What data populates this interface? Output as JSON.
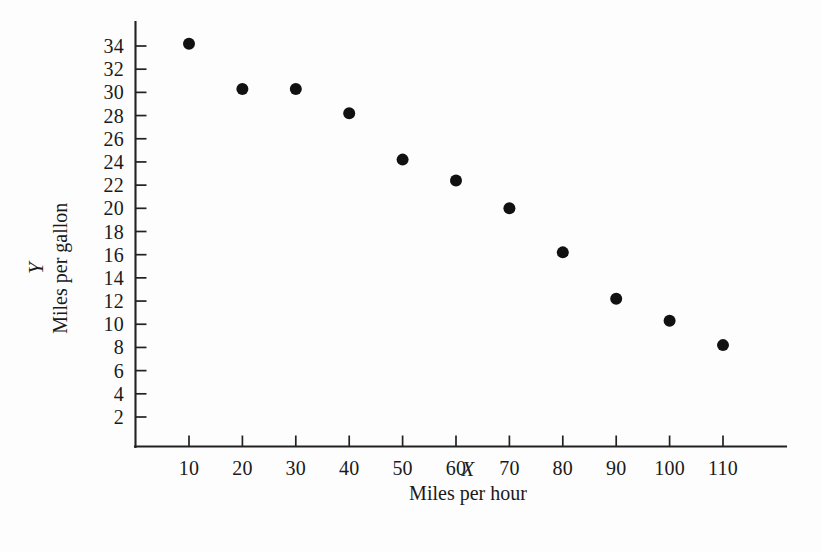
{
  "chart_data": {
    "type": "scatter",
    "title": "",
    "xlabel": "Miles per hour",
    "ylabel": "Miles per gallon",
    "x_variable_symbol": "X",
    "y_variable_symbol": "Y",
    "grid": false,
    "legend": false,
    "xlim": [
      0,
      120
    ],
    "ylim": [
      0,
      35
    ],
    "x_ticks": [
      10,
      20,
      30,
      40,
      50,
      60,
      70,
      80,
      90,
      100,
      110
    ],
    "y_ticks": [
      2,
      4,
      6,
      8,
      10,
      12,
      14,
      16,
      18,
      20,
      22,
      24,
      26,
      28,
      30,
      32,
      34
    ],
    "x_tick_labels": [
      "10",
      "20",
      "30",
      "40",
      "50",
      "60",
      "70",
      "80",
      "90",
      "100",
      "110"
    ],
    "y_tick_labels": [
      "2",
      "4",
      "6",
      "8",
      "10",
      "12",
      "14",
      "16",
      "18",
      "20",
      "22",
      "24",
      "26",
      "28",
      "30",
      "32",
      "34"
    ],
    "x": [
      10,
      20,
      30,
      40,
      50,
      60,
      70,
      80,
      90,
      100,
      110
    ],
    "y": [
      34.2,
      30.3,
      30.3,
      28.2,
      24.2,
      22.4,
      20.0,
      16.2,
      12.2,
      10.3,
      8.2
    ],
    "points": [
      {
        "x": 10,
        "y": 34.2
      },
      {
        "x": 20,
        "y": 30.3
      },
      {
        "x": 30,
        "y": 30.3
      },
      {
        "x": 40,
        "y": 28.2
      },
      {
        "x": 50,
        "y": 24.2
      },
      {
        "x": 60,
        "y": 22.4
      },
      {
        "x": 70,
        "y": 20.0
      },
      {
        "x": 80,
        "y": 16.2
      },
      {
        "x": 90,
        "y": 12.2
      },
      {
        "x": 100,
        "y": 10.3
      },
      {
        "x": 110,
        "y": 8.2
      }
    ],
    "marker": "filled-circle",
    "marker_color": "#111111",
    "marker_radius_px": 6,
    "axis_color": "#222222",
    "background_color": "#fdfdfd"
  }
}
